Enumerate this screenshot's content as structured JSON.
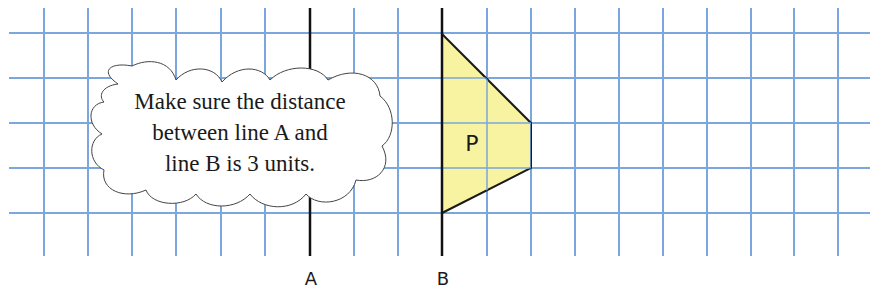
{
  "grid": {
    "color": "#7aa7dd",
    "spacing": 44.2,
    "vertical_x": [
      44,
      88,
      132,
      176,
      221,
      265,
      310,
      354,
      398,
      442,
      487,
      531,
      575,
      619,
      663,
      707,
      751,
      794,
      838
    ],
    "horizontal_y": [
      33,
      78,
      123,
      168,
      213
    ],
    "top": 8,
    "bottom": 256,
    "left": 9,
    "right": 870
  },
  "lines": [
    {
      "name": "A",
      "x": 310,
      "label": "A"
    },
    {
      "name": "B",
      "x": 442,
      "label": "B"
    }
  ],
  "shape": {
    "label": "P",
    "fill": "#f8f3a0",
    "vertices": [
      [
        442,
        34
      ],
      [
        531,
        123
      ],
      [
        531,
        168
      ],
      [
        442,
        213
      ]
    ]
  },
  "callout": {
    "lines": [
      "Make sure the distance",
      "between line A and",
      "line B is 3 units."
    ]
  }
}
